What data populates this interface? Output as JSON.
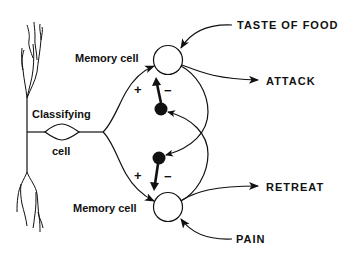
{
  "diagram": {
    "type": "neural-circuit",
    "nodes": {
      "classifying_cell": {
        "label_line1": "Classifying",
        "label_line2": "cell"
      },
      "memory_cell_top": {
        "label": "Memory cell"
      },
      "memory_cell_bottom": {
        "label": "Memory cell"
      },
      "inhibitory_interneuron_top": {
        "label": ""
      },
      "inhibitory_interneuron_bottom": {
        "label": ""
      }
    },
    "inputs": {
      "taste_of_food": "TASTE OF FOOD",
      "pain": "PAIN"
    },
    "outputs": {
      "attack": "ATTACK",
      "retreat": "RETREAT"
    },
    "signs": {
      "top_excitatory": "+",
      "top_inhibitory": "−",
      "bottom_excitatory": "+",
      "bottom_inhibitory": "−"
    },
    "colors": {
      "ink": "#111111",
      "background": "#ffffff"
    }
  }
}
